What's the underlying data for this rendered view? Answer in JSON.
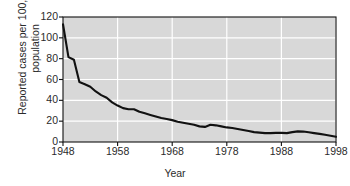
{
  "chart_data": {
    "type": "line",
    "title": "",
    "xlabel": "Year",
    "ylabel": "Reported cases per 100,000\npopulation",
    "xlim": [
      1948,
      1998
    ],
    "ylim": [
      0,
      120
    ],
    "xticks": [
      1948,
      1958,
      1968,
      1978,
      1988,
      1998
    ],
    "yticks": [
      0,
      20,
      40,
      60,
      80,
      100,
      120
    ],
    "grid": true,
    "legend": "none",
    "line_color": "#111111",
    "plot_background": "#d8d8d8",
    "gridline_color": "#ffffff",
    "x": [
      1948,
      1949,
      1950,
      1951,
      1952,
      1953,
      1954,
      1955,
      1956,
      1957,
      1958,
      1959,
      1960,
      1961,
      1962,
      1963,
      1964,
      1965,
      1966,
      1967,
      1968,
      1969,
      1970,
      1971,
      1972,
      1973,
      1974,
      1975,
      1976,
      1977,
      1978,
      1979,
      1980,
      1981,
      1982,
      1983,
      1984,
      1985,
      1986,
      1987,
      1988,
      1989,
      1990,
      1991,
      1992,
      1993,
      1994,
      1995,
      1996,
      1997,
      1998
    ],
    "values": [
      113.0,
      81.5,
      79.0,
      57.5,
      55.5,
      53.0,
      48.5,
      45.0,
      42.5,
      38.0,
      35.0,
      32.5,
      31.5,
      31.5,
      29.0,
      27.5,
      26.0,
      24.5,
      23.0,
      22.0,
      21.0,
      19.5,
      18.5,
      17.5,
      16.5,
      15.0,
      14.5,
      16.5,
      16.0,
      15.0,
      14.0,
      13.5,
      12.5,
      11.5,
      10.5,
      9.5,
      9.0,
      8.5,
      8.5,
      8.8,
      8.8,
      8.5,
      9.5,
      10.2,
      10.0,
      9.3,
      8.5,
      7.8,
      7.0,
      6.0,
      5.0
    ]
  },
  "axis": {
    "y_ticks_labels": [
      "120",
      "100",
      "80",
      "60",
      "40",
      "20",
      "0"
    ],
    "x_ticks_labels": [
      "1948",
      "1958",
      "1968",
      "1978",
      "1988",
      "1998"
    ],
    "x_title": "Year",
    "y_title_line1": "Reported cases per 100,000",
    "y_title_line2": "population"
  }
}
